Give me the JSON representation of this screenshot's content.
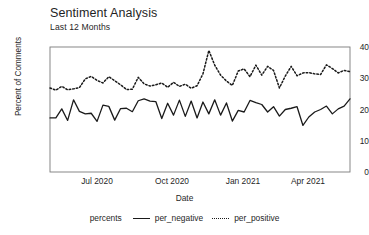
{
  "chart_data": {
    "type": "line",
    "title": "Sentiment Analysis",
    "subtitle": "Last 12 Months",
    "xlabel": "Date",
    "ylabel": "Percent of Comments",
    "ylim": [
      0,
      40
    ],
    "yticks": [
      0,
      10,
      20,
      30,
      40
    ],
    "xticks": [
      "Jul 2020",
      "Oct 2020",
      "Jan 2021",
      "Apr 2021"
    ],
    "xtick_positions": [
      97,
      172,
      243,
      308
    ],
    "grid": false,
    "legend_title": "percents",
    "legend_position": "bottom",
    "x": [
      0,
      1,
      2,
      3,
      4,
      5,
      6,
      7,
      8,
      9,
      10,
      11,
      12,
      13,
      14,
      15,
      16,
      17,
      18,
      19,
      20,
      21,
      22,
      23,
      24,
      25,
      26,
      27,
      28,
      29,
      30,
      31,
      32,
      33,
      34,
      35,
      36,
      37,
      38,
      39,
      40,
      41,
      42,
      43,
      44,
      45,
      46,
      47,
      48,
      49,
      50,
      51
    ],
    "series": [
      {
        "name": "per_negative",
        "style": "solid",
        "color": "#1a1a1a",
        "values": [
          17.3,
          17.3,
          20.2,
          16.5,
          23.1,
          19.4,
          18.6,
          18.8,
          16.2,
          21.4,
          21.0,
          16.6,
          20.3,
          20.4,
          19.3,
          22.8,
          23.4,
          22.7,
          22.5,
          17.1,
          22.0,
          18.2,
          23.0,
          17.8,
          22.7,
          17.3,
          22.4,
          18.6,
          23.1,
          18.2,
          22.1,
          16.3,
          19.7,
          19.2,
          22.9,
          22.2,
          21.6,
          19.2,
          20.9,
          17.9,
          20.0,
          20.4,
          20.9,
          14.9,
          17.6,
          19.2,
          20.0,
          21.1,
          18.6,
          20.2,
          21.1,
          23.4
        ]
      },
      {
        "name": "per_positive",
        "style": "dotted",
        "color": "#1a1a1a",
        "values": [
          26.9,
          26.2,
          27.4,
          26.3,
          26.6,
          27.0,
          29.8,
          30.6,
          29.3,
          28.5,
          30.5,
          29.2,
          27.9,
          26.4,
          26.5,
          30.3,
          28.2,
          27.5,
          27.9,
          28.5,
          27.1,
          28.7,
          27.4,
          28.1,
          26.8,
          27.6,
          31.4,
          38.9,
          34.2,
          31.0,
          29.1,
          27.7,
          32.3,
          33.0,
          30.5,
          34.2,
          31.0,
          33.8,
          32.5,
          26.9,
          30.7,
          33.8,
          30.8,
          31.7,
          31.8,
          31.4,
          31.2,
          34.3,
          33.1,
          31.7,
          32.5,
          32.1
        ]
      }
    ]
  }
}
